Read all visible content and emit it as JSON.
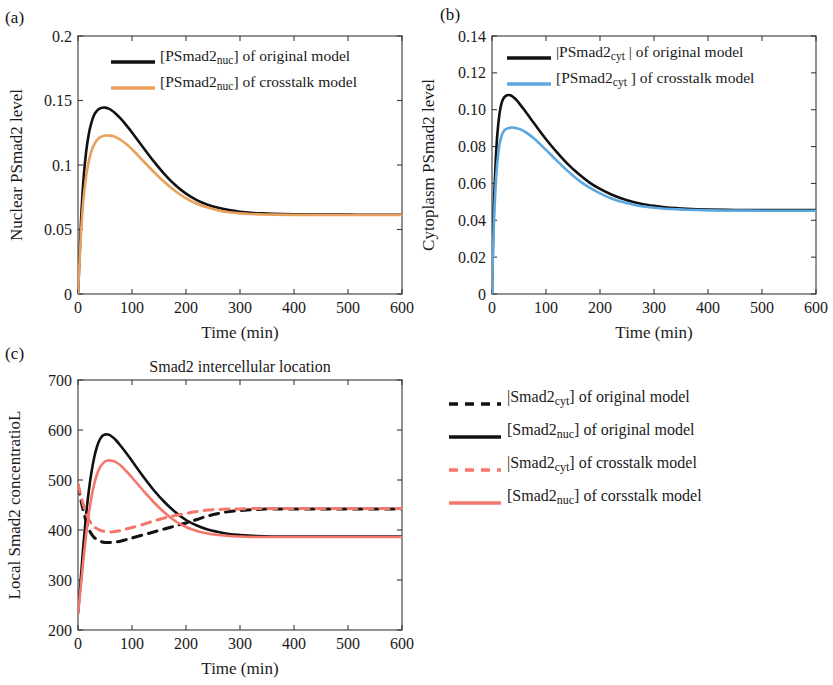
{
  "figure": {
    "panels": [
      {
        "tag": "(a)",
        "title": "",
        "xlabel": "Time (min)",
        "ylabel": "Nuclear PSmad2 level"
      },
      {
        "tag": "(b)",
        "title": "",
        "xlabel": "Time (min)",
        "ylabel": "Cytoplasm PSmad2 level"
      },
      {
        "tag": "(c)",
        "title": "Smad2 intercellular location",
        "xlabel": "Time (min)",
        "ylabel": "Local Smad2 concentratioL"
      }
    ]
  },
  "colors": {
    "black": "#111111",
    "orange": "#E9A05C",
    "blue": "#5BA8E0",
    "salmon": "#F5766A",
    "axis": "#3a3a3a"
  },
  "legend_a": [
    {
      "color_key": "black",
      "dash": false,
      "prefix": "[PSmad2",
      "sub": "nuc",
      "suffix": "] of original model"
    },
    {
      "color_key": "orange",
      "dash": false,
      "prefix": "[PSmad2",
      "sub": "nuc",
      "suffix": "] of crosstalk model"
    }
  ],
  "legend_b": [
    {
      "color_key": "black",
      "dash": false,
      "prefix": "|PSmad2",
      "sub": "cyt",
      "suffix": " | of original model"
    },
    {
      "color_key": "blue",
      "dash": false,
      "prefix": "[PSmad2",
      "sub": "cyt",
      "suffix": " ] of crosstalk model"
    }
  ],
  "legend_c": [
    {
      "color_key": "black",
      "dash": true,
      "prefix": "|Smad2",
      "sub": "cyt",
      "suffix": "] of original model"
    },
    {
      "color_key": "black",
      "dash": false,
      "prefix": "[Smad2",
      "sub": "nuc",
      "suffix": "] of original model"
    },
    {
      "color_key": "salmon",
      "dash": true,
      "prefix": "|Smad2",
      "sub": "cyt",
      "suffix": "] of crosstalk model"
    },
    {
      "color_key": "salmon",
      "dash": false,
      "prefix": "[Smad2",
      "sub": "nuc",
      "suffix": "] of corsstalk model"
    }
  ],
  "chart_data": [
    {
      "panel": "a",
      "type": "line",
      "title": "",
      "xlabel": "Time (min)",
      "ylabel": "Nuclear PSmad2 level",
      "xlim": [
        0,
        600
      ],
      "ylim": [
        0,
        0.2
      ],
      "xticks": [
        0,
        100,
        200,
        300,
        400,
        500,
        600
      ],
      "yticks": [
        0,
        0.05,
        0.1,
        0.15,
        0.2
      ],
      "xticklabels": [
        "0",
        "100",
        "200",
        "300",
        "400",
        "500",
        "600"
      ],
      "yticklabels": [
        "0",
        "0.05",
        "0.1",
        "0.15",
        "0.2"
      ],
      "grid": false,
      "legend_position": "top-center",
      "series": [
        {
          "name": "[PSmad2nuc] of original model",
          "color_key": "black",
          "dash": false,
          "x": [
            0,
            3,
            6,
            10,
            15,
            20,
            25,
            30,
            35,
            40,
            45,
            50,
            55,
            60,
            70,
            80,
            90,
            100,
            120,
            140,
            160,
            180,
            200,
            220,
            240,
            260,
            280,
            300,
            320,
            340,
            360,
            400,
            450,
            500,
            550,
            600
          ],
          "y": [
            0,
            0.03,
            0.06,
            0.088,
            0.11,
            0.124,
            0.133,
            0.139,
            0.142,
            0.1437,
            0.1444,
            0.1445,
            0.144,
            0.143,
            0.1398,
            0.1355,
            0.1305,
            0.1252,
            0.114,
            0.103,
            0.093,
            0.0845,
            0.0778,
            0.0728,
            0.0692,
            0.0668,
            0.065,
            0.0638,
            0.063,
            0.0625,
            0.0622,
            0.0618,
            0.0616,
            0.0615,
            0.0614,
            0.0614
          ]
        },
        {
          "name": "[PSmad2nuc] of crosstalk model",
          "color_key": "orange",
          "dash": false,
          "x": [
            0,
            3,
            6,
            10,
            15,
            20,
            25,
            30,
            35,
            40,
            45,
            50,
            55,
            60,
            65,
            70,
            80,
            90,
            100,
            120,
            140,
            160,
            180,
            200,
            220,
            240,
            260,
            280,
            300,
            320,
            340,
            360,
            400,
            450,
            500,
            550,
            600
          ],
          "y": [
            0,
            0.026,
            0.05,
            0.073,
            0.091,
            0.103,
            0.111,
            0.116,
            0.1192,
            0.1212,
            0.1222,
            0.1228,
            0.1229,
            0.1228,
            0.1224,
            0.1216,
            0.1192,
            0.116,
            0.1122,
            0.1035,
            0.0948,
            0.0868,
            0.0798,
            0.0742,
            0.07,
            0.067,
            0.0648,
            0.0634,
            0.0625,
            0.062,
            0.0617,
            0.0615,
            0.0613,
            0.0612,
            0.0612,
            0.0612,
            0.0612
          ]
        }
      ]
    },
    {
      "panel": "b",
      "type": "line",
      "title": "",
      "xlabel": "Time (min)",
      "ylabel": "Cytoplasm PSmad2 level",
      "xlim": [
        0,
        600
      ],
      "ylim": [
        0,
        0.14
      ],
      "xticks": [
        0,
        100,
        200,
        300,
        400,
        500,
        600
      ],
      "yticks": [
        0,
        0.02,
        0.04,
        0.06,
        0.08,
        0.1,
        0.12,
        0.14
      ],
      "xticklabels": [
        "0",
        "100",
        "200",
        "300",
        "400",
        "500",
        "600"
      ],
      "yticklabels": [
        "0",
        "0.02",
        "0.04",
        "0.06",
        "0.08",
        "0.10",
        "0.12",
        "0.14"
      ],
      "grid": false,
      "legend_position": "top-center",
      "series": [
        {
          "name": "|PSmad2cyt | of original model",
          "color_key": "black",
          "dash": false,
          "x": [
            0,
            2,
            4,
            7,
            10,
            14,
            18,
            22,
            26,
            30,
            34,
            38,
            42,
            46,
            50,
            60,
            70,
            80,
            100,
            120,
            140,
            160,
            180,
            200,
            220,
            240,
            260,
            280,
            300,
            320,
            340,
            360,
            400,
            450,
            500,
            550,
            600
          ],
          "y": [
            0,
            0.03,
            0.052,
            0.073,
            0.087,
            0.098,
            0.1038,
            0.1065,
            0.1076,
            0.108,
            0.1078,
            0.1072,
            0.1062,
            0.105,
            0.1036,
            0.0998,
            0.0958,
            0.0918,
            0.084,
            0.077,
            0.0706,
            0.0652,
            0.0606,
            0.057,
            0.0541,
            0.0518,
            0.05,
            0.0487,
            0.0478,
            0.0471,
            0.0466,
            0.0462,
            0.0458,
            0.0456,
            0.0455,
            0.0455,
            0.0455
          ]
        },
        {
          "name": "[PSmad2cyt ] of crosstalk model",
          "color_key": "blue",
          "dash": false,
          "x": [
            0,
            2,
            4,
            7,
            10,
            14,
            18,
            22,
            26,
            30,
            35,
            40,
            45,
            50,
            55,
            60,
            70,
            80,
            100,
            120,
            140,
            160,
            180,
            200,
            220,
            240,
            260,
            280,
            300,
            320,
            340,
            360,
            400,
            450,
            500,
            550,
            600
          ],
          "y": [
            0,
            0.024,
            0.042,
            0.06,
            0.0718,
            0.0812,
            0.086,
            0.0884,
            0.0895,
            0.09,
            0.0903,
            0.0903,
            0.09,
            0.0896,
            0.089,
            0.0882,
            0.0862,
            0.0838,
            0.0782,
            0.0724,
            0.0668,
            0.0618,
            0.0578,
            0.0546,
            0.052,
            0.05,
            0.0486,
            0.0475,
            0.0468,
            0.0463,
            0.046,
            0.0457,
            0.0454,
            0.0453,
            0.0452,
            0.0452,
            0.0452
          ]
        }
      ]
    },
    {
      "panel": "c",
      "type": "line",
      "title": "Smad2 intercellular location",
      "xlabel": "Time (min)",
      "ylabel": "Local Smad2 concentratioL",
      "xlim": [
        0,
        600
      ],
      "ylim": [
        200,
        700
      ],
      "xticks": [
        0,
        100,
        200,
        300,
        400,
        500,
        600
      ],
      "yticks": [
        200,
        300,
        400,
        500,
        600,
        700
      ],
      "xticklabels": [
        "0",
        "100",
        "200",
        "300",
        "400",
        "500",
        "600"
      ],
      "yticklabels": [
        "200",
        "300",
        "400",
        "500",
        "600",
        "700"
      ],
      "grid": false,
      "legend_position": "right",
      "series": [
        {
          "name": "|Smad2cyt] of original model",
          "color_key": "black",
          "dash": true,
          "x": [
            0,
            5,
            10,
            15,
            20,
            25,
            30,
            40,
            50,
            60,
            70,
            80,
            90,
            100,
            120,
            140,
            160,
            180,
            200,
            220,
            240,
            260,
            280,
            300,
            330,
            360,
            400,
            450,
            500,
            550,
            600
          ],
          "y": [
            490,
            462,
            438,
            418,
            402,
            392,
            385,
            378,
            375,
            375,
            376,
            378,
            381,
            384,
            390,
            396,
            402,
            408,
            414,
            421,
            428,
            433,
            437,
            439,
            441,
            442,
            442,
            442,
            442,
            442,
            442
          ]
        },
        {
          "name": "[Smad2nuc] of original model",
          "color_key": "black",
          "dash": false,
          "x": [
            0,
            5,
            10,
            15,
            20,
            25,
            30,
            35,
            40,
            45,
            50,
            55,
            60,
            70,
            80,
            90,
            100,
            120,
            140,
            160,
            180,
            200,
            220,
            240,
            260,
            280,
            300,
            330,
            360,
            400,
            450,
            500,
            550,
            600
          ],
          "y": [
            233,
            300,
            370,
            430,
            478,
            516,
            545,
            566,
            580,
            588,
            591,
            591,
            589,
            580,
            567,
            553,
            538,
            508,
            480,
            456,
            436,
            420,
            409,
            401,
            396,
            392,
            390,
            388,
            387,
            387,
            387,
            387,
            387,
            387
          ]
        },
        {
          "name": "|Smad2cyt] of crosstalk model",
          "color_key": "salmon",
          "dash": true,
          "x": [
            0,
            5,
            10,
            15,
            20,
            25,
            30,
            40,
            50,
            60,
            70,
            80,
            90,
            100,
            120,
            140,
            160,
            180,
            200,
            220,
            240,
            260,
            280,
            300,
            330,
            360,
            400,
            450,
            500,
            550,
            600
          ],
          "y": [
            492,
            470,
            450,
            433,
            421,
            412,
            406,
            400,
            397,
            396,
            397,
            399,
            402,
            405,
            411,
            418,
            424,
            429,
            433,
            437,
            440,
            441,
            442,
            442,
            443,
            443,
            443,
            443,
            443,
            443,
            443
          ]
        },
        {
          "name": "[Smad2nuc] of corsstalk model",
          "color_key": "salmon",
          "dash": false,
          "x": [
            0,
            5,
            10,
            15,
            20,
            25,
            30,
            35,
            40,
            45,
            50,
            55,
            60,
            65,
            70,
            80,
            90,
            100,
            120,
            140,
            160,
            180,
            200,
            220,
            240,
            260,
            280,
            300,
            330,
            360,
            400,
            450,
            500,
            550,
            600
          ],
          "y": [
            233,
            285,
            340,
            390,
            432,
            466,
            492,
            511,
            524,
            532,
            537,
            539,
            539,
            538,
            536,
            528,
            517,
            505,
            480,
            456,
            435,
            418,
            406,
            398,
            393,
            390,
            388,
            387,
            386,
            386,
            386,
            386,
            386,
            386,
            386
          ]
        }
      ]
    }
  ]
}
